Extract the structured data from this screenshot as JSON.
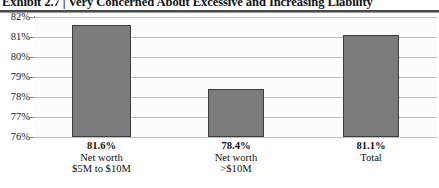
{
  "exhibit": {
    "title": "Exhibit 2.7  |  Very Concerned About Excessive and Increasing Liability"
  },
  "chart_data": {
    "type": "bar",
    "title": "Exhibit 2.7  |  Very Concerned About Excessive and Increasing Liability",
    "xlabel": "",
    "ylabel": "",
    "ylim": [
      76,
      82
    ],
    "ytick_labels": [
      "82%",
      "81%",
      "80%",
      "79%",
      "78%",
      "77%",
      "76%"
    ],
    "yticks": [
      82,
      81,
      80,
      79,
      78,
      77,
      76
    ],
    "grid": true,
    "legend": false,
    "bar_color": "#7b7b7b",
    "bar_edge_color": "#3d3d3d",
    "categories": [
      "Net worth $5M to $10M",
      "Net worth >$10M",
      "Total"
    ],
    "category_lines": [
      [
        "Net worth",
        "$5M to $10M"
      ],
      [
        "Net worth",
        ">$10M"
      ],
      [
        "Total",
        ""
      ]
    ],
    "values": [
      81.6,
      78.4,
      81.1
    ],
    "value_labels": [
      "81.6%",
      "78.4%",
      "81.1%"
    ]
  }
}
